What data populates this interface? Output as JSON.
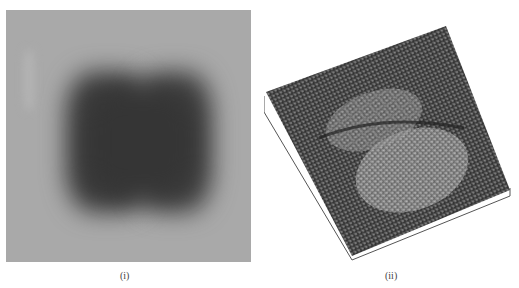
{
  "figure": {
    "panels": [
      {
        "id": "i",
        "label": "(i)",
        "type": "grayscale-2d-image",
        "description": "blurred dark square with two lobes on gray background",
        "colors": {
          "background": "#a9a9a9",
          "blob": "#3a3a3a"
        }
      },
      {
        "id": "ii",
        "label": "(ii)",
        "type": "3d-surface-mesh",
        "description": "noisy wireframe surface plot of the same image, tilted",
        "colors": {
          "mesh": "#333333",
          "highlight": "#d8d8d8"
        }
      }
    ]
  }
}
